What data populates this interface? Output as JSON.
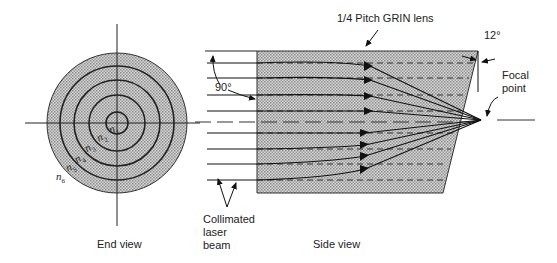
{
  "diagram": {
    "end_view": {
      "caption": "End view",
      "index_labels": [
        {
          "base": "n",
          "sub": "1"
        },
        {
          "base": "n",
          "sub": "2"
        },
        {
          "base": "n",
          "sub": "3"
        },
        {
          "base": "n",
          "sub": "4"
        },
        {
          "base": "n",
          "sub": "5"
        },
        {
          "base": "n",
          "sub": "6"
        }
      ]
    },
    "side_view": {
      "caption": "Side view",
      "lens_label": "1/4 Pitch GRIN lens",
      "angle_right": "90°",
      "angle_tilt": "12°",
      "focal_label_line1": "Focal",
      "focal_label_line2": "point",
      "beam_label_line1": "Collimated",
      "beam_label_line2": "laser",
      "beam_label_line3": "beam"
    },
    "colors": {
      "fill": "#c9c9c9",
      "line": "#222222",
      "background": "#ffffff"
    }
  }
}
